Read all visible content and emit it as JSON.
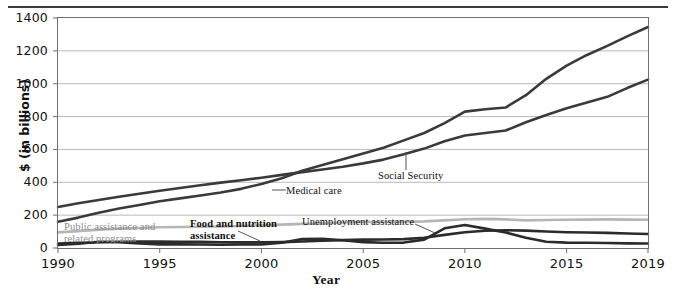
{
  "chart_data": {
    "type": "line",
    "title": "",
    "xlabel": "Year",
    "ylabel": "$ (in billions)",
    "xlim": [
      1990,
      2019
    ],
    "ylim": [
      0,
      1400
    ],
    "yticks": [
      0,
      200,
      400,
      600,
      800,
      1000,
      1200,
      1400
    ],
    "xticks": [
      1990,
      1995,
      2000,
      2005,
      2010,
      2015,
      2019
    ],
    "grid": "horizontal",
    "legend": "inline-annotations",
    "x": [
      1990,
      1991,
      1992,
      1993,
      1994,
      1995,
      1996,
      1997,
      1998,
      1999,
      2000,
      2001,
      2002,
      2003,
      2004,
      2005,
      2006,
      2007,
      2008,
      2009,
      2010,
      2011,
      2012,
      2013,
      2014,
      2015,
      2016,
      2017,
      2018,
      2019
    ],
    "series": [
      {
        "name": "Medical care",
        "color": "#3a3a3a",
        "width": 2.6,
        "values": [
          160,
          185,
          215,
          240,
          262,
          285,
          302,
          320,
          338,
          360,
          390,
          425,
          470,
          505,
          540,
          575,
          610,
          655,
          700,
          760,
          830,
          845,
          855,
          930,
          1030,
          1110,
          1175,
          1230,
          1290,
          1345
        ]
      },
      {
        "name": "Social Security",
        "color": "#3a3a3a",
        "width": 2.6,
        "values": [
          250,
          272,
          292,
          312,
          330,
          348,
          365,
          382,
          398,
          412,
          428,
          445,
          462,
          478,
          495,
          515,
          538,
          570,
          605,
          650,
          685,
          700,
          715,
          765,
          810,
          850,
          885,
          920,
          975,
          1025
        ]
      },
      {
        "name": "Public assistance and related programs",
        "color": "#b5b5b5",
        "width": 2.6,
        "values": [
          95,
          103,
          112,
          118,
          122,
          126,
          128,
          129,
          131,
          134,
          138,
          142,
          147,
          151,
          155,
          158,
          158,
          159,
          162,
          168,
          175,
          177,
          174,
          168,
          170,
          172,
          173,
          174,
          173,
          172
        ]
      },
      {
        "name": "Food and nutrition assistance",
        "color": "#2b2b2b",
        "width": 2.6,
        "values": [
          27,
          31,
          35,
          38,
          39,
          39,
          38,
          37,
          35,
          34,
          34,
          36,
          40,
          44,
          48,
          51,
          52,
          54,
          62,
          80,
          96,
          105,
          108,
          106,
          100,
          96,
          94,
          92,
          88,
          85
        ]
      },
      {
        "name": "Unemployment assistance",
        "color": "#2b2b2b",
        "width": 2.6,
        "values": [
          18,
          26,
          38,
          35,
          27,
          22,
          22,
          21,
          20,
          21,
          21,
          32,
          54,
          56,
          47,
          36,
          32,
          33,
          51,
          120,
          140,
          118,
          94,
          63,
          38,
          33,
          32,
          30,
          28,
          27
        ]
      }
    ],
    "annotations": [
      {
        "name": "medical-care",
        "text": "Medical care",
        "style": "plain",
        "x": 286,
        "y": 185
      },
      {
        "name": "social-security",
        "text": "Social Security",
        "style": "plain",
        "x": 378,
        "y": 170
      },
      {
        "name": "public-assistance",
        "text": "Public assistance and\nrelated programs",
        "style": "gray",
        "x": 64,
        "y": 221
      },
      {
        "name": "food-nutrition",
        "text": "Food and nutrition\nassistance",
        "style": "bold",
        "x": 190,
        "y": 218
      },
      {
        "name": "unemployment",
        "text": "Unemployment assistance",
        "style": "plain",
        "x": 302,
        "y": 216
      }
    ]
  }
}
